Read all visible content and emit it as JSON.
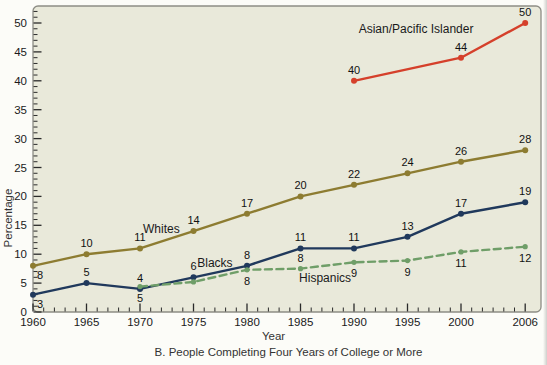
{
  "caption": "B. People Completing Four Years of College or More",
  "chart_data": {
    "type": "line",
    "title": "",
    "xlabel": "Year",
    "ylabel": "Percentage",
    "x_ticks": [
      1960,
      1965,
      1970,
      1975,
      1980,
      1985,
      1990,
      1995,
      2000,
      2006
    ],
    "x_minor_step": 1,
    "ylim": [
      0,
      52
    ],
    "y_major_step": 5,
    "y_minor_step": 1,
    "grid": false,
    "legend_position": "inline-labels",
    "colors": {
      "plot_bg": "#e9e9da",
      "border": "#8d8d85",
      "tick": "#2a2a2a",
      "text": "#1a1a1a"
    },
    "series": [
      {
        "name": "Asian/Pacific Islander",
        "color": "#d5402b",
        "dash": false,
        "name_label": {
          "x": 1995.8,
          "y": 48.3
        },
        "points": [
          {
            "x": 1990,
            "v": 40,
            "label": "40",
            "label_pos": "above"
          },
          {
            "x": 2000,
            "v": 44,
            "label": "44",
            "label_pos": "above"
          },
          {
            "x": 2006,
            "v": 50,
            "label": "50",
            "label_pos": "above"
          }
        ]
      },
      {
        "name": "Whites",
        "color": "#8d7c31",
        "dash": false,
        "name_label": {
          "x": 1972.0,
          "y": 13.6
        },
        "points": [
          {
            "x": 1960,
            "v": 8,
            "label": "8",
            "label_pos": "below-right"
          },
          {
            "x": 1965,
            "v": 10,
            "label": "10",
            "label_pos": "above"
          },
          {
            "x": 1970,
            "v": 11,
            "label": "11",
            "label_pos": "above"
          },
          {
            "x": 1975,
            "v": 14,
            "label": "14",
            "label_pos": "above"
          },
          {
            "x": 1980,
            "v": 17,
            "label": "17",
            "label_pos": "above"
          },
          {
            "x": 1985,
            "v": 20,
            "label": "20",
            "label_pos": "above"
          },
          {
            "x": 1990,
            "v": 22,
            "label": "22",
            "label_pos": "above"
          },
          {
            "x": 1995,
            "v": 24,
            "label": "24",
            "label_pos": "above"
          },
          {
            "x": 2000,
            "v": 26,
            "label": "26",
            "label_pos": "above"
          },
          {
            "x": 2006,
            "v": 28,
            "label": "28",
            "label_pos": "above"
          }
        ]
      },
      {
        "name": "Blacks",
        "color": "#20395c",
        "dash": false,
        "name_label": {
          "x": 1977.0,
          "y": 7.8
        },
        "points": [
          {
            "x": 1960,
            "v": 3,
            "label": "3",
            "label_pos": "below-right"
          },
          {
            "x": 1965,
            "v": 5,
            "label": "5",
            "label_pos": "above"
          },
          {
            "x": 1970,
            "v": 4,
            "label": "4",
            "label_pos": "above"
          },
          {
            "x": 1975,
            "v": 6,
            "label": "6",
            "label_pos": "above"
          },
          {
            "x": 1980,
            "v": 8,
            "label": "8",
            "label_pos": "above"
          },
          {
            "x": 1985,
            "v": 11,
            "label": "11",
            "label_pos": "above"
          },
          {
            "x": 1990,
            "v": 11,
            "label": "11",
            "label_pos": "above"
          },
          {
            "x": 1995,
            "v": 13,
            "label": "13",
            "label_pos": "above"
          },
          {
            "x": 2000,
            "v": 17,
            "label": "17",
            "label_pos": "above"
          },
          {
            "x": 2006,
            "v": 19,
            "label": "19",
            "label_pos": "above"
          }
        ]
      },
      {
        "name": "Hispanics",
        "color": "#6f9e68",
        "dash": true,
        "name_label": {
          "x": 1987.3,
          "y": 5.2
        },
        "points": [
          {
            "x": 1970,
            "v": 5,
            "label": "5",
            "label_pos": "below",
            "render_v": 4.4
          },
          {
            "x": 1975,
            "v": 5,
            "label": "",
            "label_pos": "below",
            "render_v": 5.2
          },
          {
            "x": 1980,
            "v": 8,
            "label": "8",
            "label_pos": "below",
            "render_v": 7.3
          },
          {
            "x": 1985,
            "v": 8,
            "label": "8",
            "label_pos": "above",
            "render_v": 7.5
          },
          {
            "x": 1990,
            "v": 9,
            "label": "9",
            "label_pos": "below",
            "render_v": 8.6
          },
          {
            "x": 1995,
            "v": 9,
            "label": "9",
            "label_pos": "below",
            "render_v": 8.9
          },
          {
            "x": 2000,
            "v": 11,
            "label": "11",
            "label_pos": "below",
            "render_v": 10.4
          },
          {
            "x": 2006,
            "v": 12,
            "label": "12",
            "label_pos": "below",
            "render_v": 11.3
          }
        ]
      }
    ]
  }
}
